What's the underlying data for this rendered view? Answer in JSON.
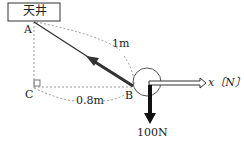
{
  "diagram": {
    "ceiling_label": "天井",
    "point_a": "A",
    "point_b": "B",
    "point_c": "C",
    "rope_length": "1m",
    "horizontal_distance": "0.8m",
    "x_axis_label": "x〔N〕",
    "weight_force": "100N"
  }
}
